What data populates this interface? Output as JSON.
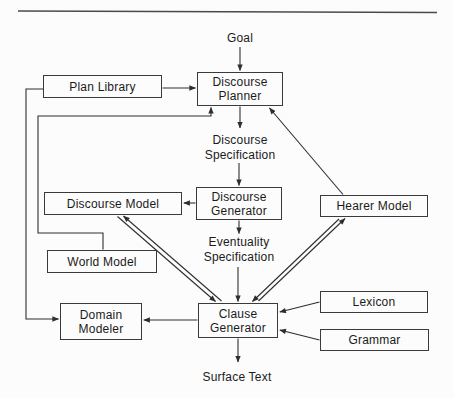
{
  "page": {
    "background": "#fcfcfc",
    "line_color": "#2e2e2e",
    "rule_color": "#4a4a4a",
    "text_color": "#1b1b1b"
  },
  "diagram": {
    "boxes": {
      "plan_library": {
        "label": "Plan Library"
      },
      "discourse_planner": {
        "label": "Discourse Planner"
      },
      "discourse_model": {
        "label": "Discourse Model"
      },
      "discourse_generator": {
        "label": "Discourse Generator"
      },
      "hearer_model": {
        "label": "Hearer Model"
      },
      "world_model": {
        "label": "World Model"
      },
      "domain_modeler": {
        "label": "Domain Modeler"
      },
      "clause_generator": {
        "label": "Clause Generator"
      },
      "lexicon": {
        "label": "Lexicon"
      },
      "grammar": {
        "label": "Grammar"
      }
    },
    "labels": {
      "goal": "Goal",
      "discourse_specification": "Discourse Specification",
      "eventuality_specification": "Eventuality Specification",
      "surface_text": "Surface Text"
    },
    "connections": [
      {
        "from": "Goal",
        "to": "Discourse Planner",
        "style": "single-arrow"
      },
      {
        "from": "Plan Library",
        "to": "Discourse Planner",
        "style": "single-arrow"
      },
      {
        "from": "Plan Library",
        "to": "Domain Modeler",
        "style": "single-arrow-routed-left"
      },
      {
        "from": "World Model",
        "to": "Discourse Planner",
        "style": "single-arrow-routed-left"
      },
      {
        "from": "Discourse Planner",
        "to": "Discourse Specification",
        "style": "single-arrow"
      },
      {
        "from": "Discourse Specification",
        "to": "Discourse Generator",
        "style": "single-arrow"
      },
      {
        "from": "Discourse Generator",
        "to": "Discourse Model",
        "style": "single-arrow"
      },
      {
        "from": "Discourse Generator",
        "to": "Eventuality Specification",
        "style": "single-arrow"
      },
      {
        "from": "Eventuality Specification",
        "to": "Clause Generator",
        "style": "single-arrow"
      },
      {
        "from": "Discourse Model",
        "to": "Clause Generator",
        "style": "double-line-bidirectional"
      },
      {
        "from": "Clause Generator",
        "to": "Hearer Model",
        "style": "double-line-bidirectional"
      },
      {
        "from": "Hearer Model",
        "to": "Discourse Planner",
        "style": "single-arrow-diagonal"
      },
      {
        "from": "Lexicon",
        "to": "Clause Generator",
        "style": "single-arrow"
      },
      {
        "from": "Grammar",
        "to": "Clause Generator",
        "style": "single-arrow"
      },
      {
        "from": "Clause Generator",
        "to": "Domain Modeler",
        "style": "single-arrow"
      },
      {
        "from": "Domain Modeler",
        "to": "World Model",
        "style": "single-arrow"
      },
      {
        "from": "Clause Generator",
        "to": "Surface Text",
        "style": "single-arrow"
      }
    ]
  }
}
